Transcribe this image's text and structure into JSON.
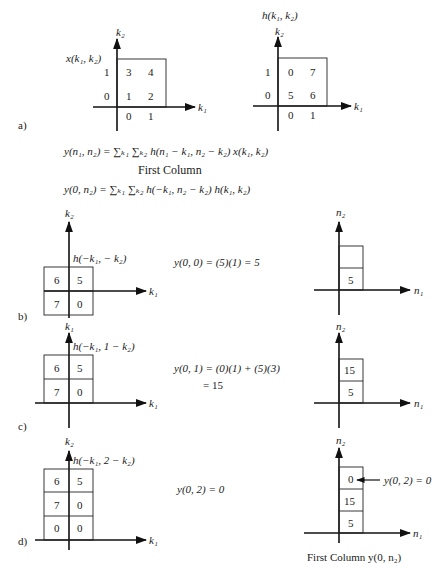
{
  "panel_labels": {
    "a": "a)",
    "b": "b)",
    "c": "c)",
    "d": "d)"
  },
  "panel_a": {
    "x_signal": {
      "title": "x(k₁, k₂)",
      "axis_v": "k₂",
      "axis_h": "k₁",
      "row_ticks": [
        "1",
        "0"
      ],
      "col_ticks": [
        "0",
        "1"
      ],
      "values": [
        [
          "3",
          "4"
        ],
        [
          "1",
          "2"
        ]
      ]
    },
    "h_signal": {
      "title": "h(k₁, k₂)",
      "axis_v": "k₂",
      "axis_h": "k₁",
      "row_ticks": [
        "1",
        "0"
      ],
      "col_ticks": [
        "0",
        "1"
      ],
      "values": [
        [
          "0",
          "7"
        ],
        [
          "5",
          "6"
        ]
      ]
    },
    "equation_general": "y(n₁, n₂) = ∑ₖ₁  ∑ₖ₂ h(n₁ − k₁, n₂ − k₂) x(k₁, k₂)",
    "subtitle": "First Column",
    "equation_first_column": "y(0, n₂) = ∑ₖ₁  ∑ₖ₂ h(−k₁, n₂ − k₂)  h(k₁, k₂)"
  },
  "panel_b": {
    "left": {
      "axis_v": "k₂",
      "axis_h": "k₁",
      "label": "h(−k₁, − k₂)",
      "cells": [
        [
          "6",
          "5"
        ],
        [
          "7",
          "0"
        ]
      ]
    },
    "equation": "y(0, 0) = (5)(1) = 5",
    "right": {
      "axis_v": "n₂",
      "axis_h": "n₁",
      "cells": [
        "",
        "5"
      ]
    }
  },
  "panel_c": {
    "left": {
      "axis_v": "k₁",
      "axis_h": "k₁",
      "label": "h(−k₁, 1 − k₂)",
      "cells": [
        [
          "6",
          "5"
        ],
        [
          "7",
          "0"
        ]
      ]
    },
    "equation_line1": "y(0, 1) = (0)(1) + (5)(3)",
    "equation_line2": "= 15",
    "right": {
      "axis_v": "n₂",
      "axis_h": "n₁",
      "cells": [
        "15",
        "5"
      ]
    }
  },
  "panel_d": {
    "left": {
      "axis_v": "k₂",
      "axis_h": "k₁",
      "label": "h(−k₁, 2 − k₂)",
      "cells": [
        [
          "6",
          "5"
        ],
        [
          "7",
          "0"
        ],
        [
          "0",
          "0"
        ]
      ]
    },
    "equation": "y(0, 2) = 0",
    "right": {
      "axis_v": "n₂",
      "axis_h": "n₁",
      "cells": [
        "0",
        "15",
        "5"
      ],
      "annotation": "y(0, 2) = 0"
    },
    "caption": "First Column  y(0, n₂)"
  }
}
